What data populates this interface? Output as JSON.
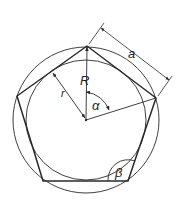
{
  "figure": {
    "type": "regular-pentagon-geometry",
    "labels": {
      "side_length": "a",
      "circumradius": "R",
      "inradius": "r",
      "central_angle": "α",
      "interior_angle": "β"
    },
    "colors": {
      "stroke": "#2a2a2a",
      "background": "#ffffff"
    }
  }
}
